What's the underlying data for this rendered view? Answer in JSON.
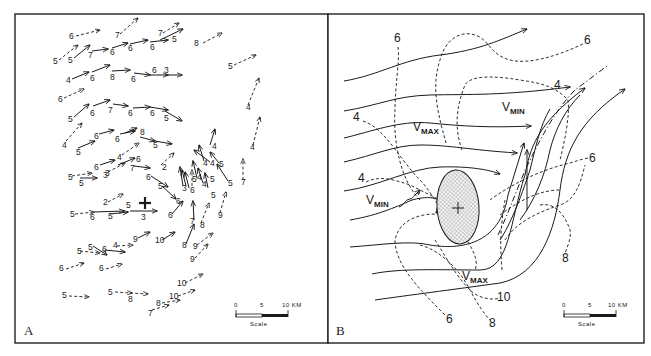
{
  "figure": {
    "panel_a": {
      "letter": "A",
      "scale": {
        "ticks": [
          "0",
          "5",
          "10 KM"
        ],
        "label": "Scale"
      },
      "center_marker": "+",
      "vector_labels": [
        {
          "t": "6",
          "x": 69,
          "y": 39
        },
        {
          "t": "7",
          "x": 115,
          "y": 38
        },
        {
          "t": "7",
          "x": 158,
          "y": 36
        },
        {
          "t": "5",
          "x": 53,
          "y": 64
        },
        {
          "t": "5",
          "x": 68,
          "y": 63
        },
        {
          "t": "7",
          "x": 88,
          "y": 58
        },
        {
          "t": "6",
          "x": 110,
          "y": 55
        },
        {
          "t": "6",
          "x": 128,
          "y": 51
        },
        {
          "t": "6",
          "x": 150,
          "y": 50
        },
        {
          "t": "5",
          "x": 172,
          "y": 42
        },
        {
          "t": "8",
          "x": 194,
          "y": 46
        },
        {
          "t": "4",
          "x": 66,
          "y": 83
        },
        {
          "t": "6",
          "x": 90,
          "y": 81
        },
        {
          "t": "8",
          "x": 110,
          "y": 80
        },
        {
          "t": "6",
          "x": 131,
          "y": 82
        },
        {
          "t": "6",
          "x": 152,
          "y": 73
        },
        {
          "t": "3",
          "x": 164,
          "y": 73
        },
        {
          "t": "5",
          "x": 228,
          "y": 69
        },
        {
          "t": "6",
          "x": 58,
          "y": 102
        },
        {
          "t": "5",
          "x": 68,
          "y": 122
        },
        {
          "t": "6",
          "x": 90,
          "y": 116
        },
        {
          "t": "7",
          "x": 108,
          "y": 113
        },
        {
          "t": "6",
          "x": 128,
          "y": 116
        },
        {
          "t": "6",
          "x": 150,
          "y": 116
        },
        {
          "t": "5",
          "x": 164,
          "y": 121
        },
        {
          "t": "4",
          "x": 246,
          "y": 110
        },
        {
          "t": "4",
          "x": 250,
          "y": 150
        },
        {
          "t": "4",
          "x": 62,
          "y": 148
        },
        {
          "t": "6",
          "x": 94,
          "y": 139
        },
        {
          "t": "6",
          "x": 115,
          "y": 142
        },
        {
          "t": "8",
          "x": 140,
          "y": 135
        },
        {
          "t": "5",
          "x": 76,
          "y": 155
        },
        {
          "t": "5",
          "x": 153,
          "y": 148
        },
        {
          "t": "4",
          "x": 117,
          "y": 160
        },
        {
          "t": "6",
          "x": 136,
          "y": 162
        },
        {
          "t": "4",
          "x": 212,
          "y": 149
        },
        {
          "t": "6",
          "x": 94,
          "y": 170
        },
        {
          "t": "3",
          "x": 105,
          "y": 176
        },
        {
          "t": "7",
          "x": 130,
          "y": 171
        },
        {
          "t": "2",
          "x": 162,
          "y": 170
        },
        {
          "t": "4",
          "x": 203,
          "y": 166
        },
        {
          "t": "4",
          "x": 210,
          "y": 166
        },
        {
          "t": "5",
          "x": 219,
          "y": 167
        },
        {
          "t": "6",
          "x": 146,
          "y": 180
        },
        {
          "t": "5",
          "x": 68,
          "y": 180
        },
        {
          "t": "5",
          "x": 79,
          "y": 186
        },
        {
          "t": "3",
          "x": 103,
          "y": 178
        },
        {
          "t": "5",
          "x": 158,
          "y": 189
        },
        {
          "t": "3",
          "x": 182,
          "y": 191
        },
        {
          "t": "6",
          "x": 190,
          "y": 193
        },
        {
          "t": "5",
          "x": 192,
          "y": 182
        },
        {
          "t": "4",
          "x": 197,
          "y": 180
        },
        {
          "t": "4",
          "x": 202,
          "y": 187
        },
        {
          "t": "5",
          "x": 210,
          "y": 182
        },
        {
          "t": "5",
          "x": 228,
          "y": 186
        },
        {
          "t": "7",
          "x": 241,
          "y": 185
        },
        {
          "t": "6",
          "x": 176,
          "y": 204
        },
        {
          "t": "5",
          "x": 211,
          "y": 198
        },
        {
          "t": "9",
          "x": 218,
          "y": 218
        },
        {
          "t": "2",
          "x": 103,
          "y": 205
        },
        {
          "t": "5",
          "x": 126,
          "y": 208
        },
        {
          "t": "5",
          "x": 70,
          "y": 217
        },
        {
          "t": "6",
          "x": 90,
          "y": 220
        },
        {
          "t": "5",
          "x": 108,
          "y": 219
        },
        {
          "t": "3",
          "x": 141,
          "y": 220
        },
        {
          "t": "6",
          "x": 168,
          "y": 218
        },
        {
          "t": "7",
          "x": 190,
          "y": 224
        },
        {
          "t": "8",
          "x": 200,
          "y": 228
        },
        {
          "t": "9",
          "x": 133,
          "y": 242
        },
        {
          "t": "10",
          "x": 155,
          "y": 243
        },
        {
          "t": "8",
          "x": 182,
          "y": 248
        },
        {
          "t": "9",
          "x": 193,
          "y": 249
        },
        {
          "t": "9",
          "x": 190,
          "y": 262
        },
        {
          "t": "5",
          "x": 88,
          "y": 250
        },
        {
          "t": "5",
          "x": 77,
          "y": 254
        },
        {
          "t": "6",
          "x": 102,
          "y": 252
        },
        {
          "t": "4",
          "x": 113,
          "y": 248
        },
        {
          "t": "6",
          "x": 59,
          "y": 271
        },
        {
          "t": "6",
          "x": 99,
          "y": 271
        },
        {
          "t": "10",
          "x": 177,
          "y": 286
        },
        {
          "t": "10",
          "x": 169,
          "y": 299
        },
        {
          "t": "5",
          "x": 62,
          "y": 298
        },
        {
          "t": "5",
          "x": 108,
          "y": 295
        },
        {
          "t": "8",
          "x": 128,
          "y": 302
        },
        {
          "t": "8",
          "x": 156,
          "y": 306
        },
        {
          "t": "7",
          "x": 148,
          "y": 316
        }
      ]
    },
    "panel_b": {
      "letter": "B",
      "scale": {
        "ticks": [
          "0",
          "5",
          "10 KM"
        ],
        "label": "Scale"
      },
      "center_marker": "+",
      "contour_labels": [
        {
          "t": "6",
          "x": 394,
          "y": 42
        },
        {
          "t": "6",
          "x": 584,
          "y": 44
        },
        {
          "t": "4",
          "x": 554,
          "y": 89
        },
        {
          "t": "4",
          "x": 353,
          "y": 121
        },
        {
          "t": "6",
          "x": 589,
          "y": 162
        },
        {
          "t": "4",
          "x": 358,
          "y": 182
        },
        {
          "t": "8",
          "x": 562,
          "y": 262
        },
        {
          "t": "10",
          "x": 497,
          "y": 301
        },
        {
          "t": "6",
          "x": 446,
          "y": 323
        },
        {
          "t": "8",
          "x": 489,
          "y": 327
        }
      ],
      "annotations": [
        {
          "t": "V",
          "sub": "MAX",
          "x": 413,
          "y": 131
        },
        {
          "t": "V",
          "sub": "MIN",
          "x": 502,
          "y": 111
        },
        {
          "t": "V",
          "sub": "MIN",
          "x": 366,
          "y": 204
        },
        {
          "t": "V",
          "sub": "MAX",
          "x": 462,
          "y": 280
        }
      ]
    }
  }
}
